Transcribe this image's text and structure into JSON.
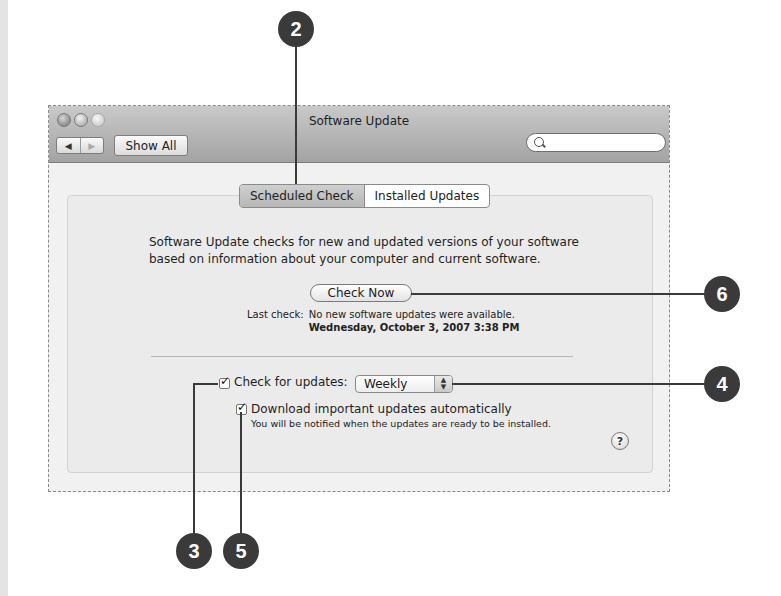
{
  "window": {
    "title": "Software Update",
    "show_all_label": "Show All",
    "nav_back_icon": "◀",
    "nav_forward_icon": "▶",
    "search": {
      "placeholder": "",
      "value": ""
    }
  },
  "tabs": [
    {
      "label": "Scheduled Check",
      "selected": true
    },
    {
      "label": "Installed Updates",
      "selected": false
    }
  ],
  "scheduled": {
    "description_line1": "Software Update checks for new and updated versions of your software",
    "description_line2": "based on information about your computer and current software.",
    "check_now_label": "Check Now",
    "last_check_label": "Last check:",
    "last_check_status": "No new software updates were available.",
    "last_check_time": "Wednesday, October 3, 2007 3:38 PM",
    "check_for_updates": {
      "label": "Check for updates:",
      "checked": true,
      "frequency": "Weekly"
    },
    "download_auto": {
      "label": "Download important updates automatically",
      "checked": true,
      "note": "You will be notified when the updates are ready to be installed."
    },
    "help_label": "?"
  },
  "callouts": [
    {
      "number": "2",
      "target": "tab-scheduled-check"
    },
    {
      "number": "6",
      "target": "check-now-button"
    },
    {
      "number": "4",
      "target": "frequency-popup"
    },
    {
      "number": "3",
      "target": "check-for-updates-checkbox"
    },
    {
      "number": "5",
      "target": "download-automatically-checkbox"
    }
  ],
  "colors": {
    "callout": "#3a3a3a",
    "titlebar_top": "#c9c9c9",
    "titlebar_bottom": "#a3a3a3"
  }
}
